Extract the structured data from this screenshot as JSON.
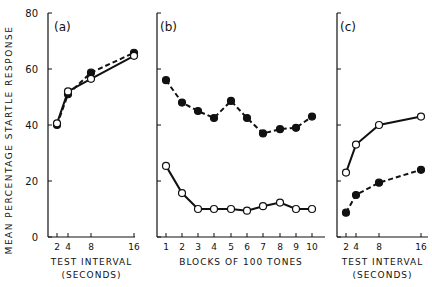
{
  "ylabel": "MEAN PERCENTAGE STARTLE RESPONSE",
  "yticks": [
    0,
    20,
    40,
    60,
    80
  ],
  "chart_data": [
    {
      "type": "line",
      "panel": "(a)",
      "xlabel": "TEST INTERVAL",
      "xlabel2": "(SECONDS)",
      "x": [
        2,
        4,
        8,
        16
      ],
      "ylim": [
        0,
        80
      ],
      "series": [
        {
          "name": "filled",
          "style": "dashed",
          "values": [
            40,
            51,
            58.7,
            65.8
          ]
        },
        {
          "name": "open",
          "style": "solid",
          "values": [
            40.6,
            52,
            56.5,
            64.7
          ]
        }
      ]
    },
    {
      "type": "line",
      "panel": "(b)",
      "xlabel": "BLOCKS OF 100 TONES",
      "x": [
        1,
        2,
        3,
        4,
        5,
        6,
        7,
        8,
        9,
        10
      ],
      "ylim": [
        0,
        80
      ],
      "series": [
        {
          "name": "filled",
          "style": "dashed",
          "values": [
            56,
            48,
            45,
            42.5,
            48.6,
            42.5,
            37,
            38.5,
            39,
            43
          ]
        },
        {
          "name": "open",
          "style": "solid",
          "values": [
            25.4,
            15.7,
            10,
            10,
            10,
            9.4,
            11,
            12.3,
            10,
            10
          ]
        }
      ]
    },
    {
      "type": "line",
      "panel": "(c)",
      "xlabel": "TEST INTERVAL",
      "xlabel2": "(SECONDS)",
      "x": [
        2,
        4,
        8,
        16
      ],
      "ylim": [
        0,
        80
      ],
      "series": [
        {
          "name": "open",
          "style": "solid",
          "values": [
            23,
            33,
            40,
            43
          ]
        },
        {
          "name": "filled",
          "style": "dashed",
          "values": [
            8.7,
            15,
            19.4,
            24
          ]
        }
      ]
    }
  ]
}
